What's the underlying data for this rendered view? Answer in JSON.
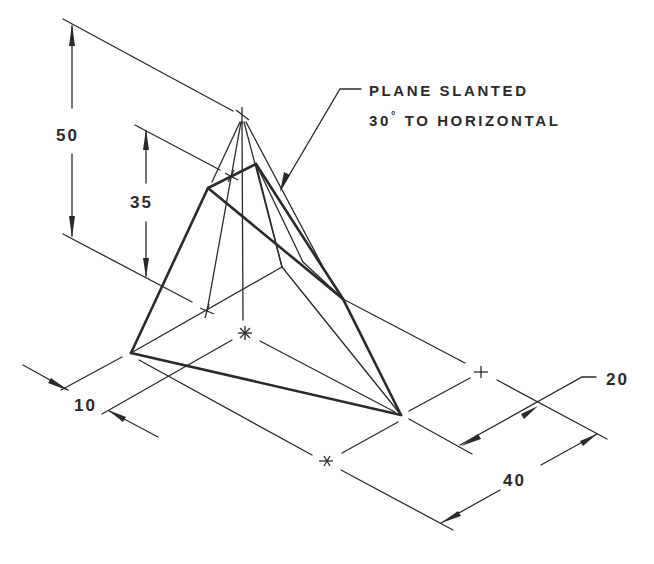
{
  "drawing": {
    "type": "isometric technical drawing",
    "subject": "pyramid truncated by a slanted plane",
    "line_color": "#2a2a2a",
    "background": "#ffffff"
  },
  "note": {
    "line1": "PLANE SLANTED",
    "line2_prefix": "30",
    "line2_degree": "°",
    "line2_suffix": " TO HORIZONTAL"
  },
  "dimensions": {
    "height_apex": "50",
    "height_plane": "35",
    "offset": "10",
    "depth": "20",
    "width": "40"
  }
}
